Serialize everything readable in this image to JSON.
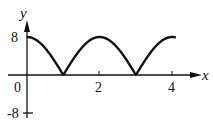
{
  "chart_data": {
    "type": "line",
    "title": "",
    "xlabel": "x",
    "ylabel": "y",
    "function": "y = |8 cos(πx/2)|",
    "xlim": [
      0,
      4.1
    ],
    "ylim": [
      -8,
      8
    ],
    "grid": false,
    "legend": null,
    "x_ticks": [
      "0",
      "2",
      "4"
    ],
    "y_ticks": [
      "8",
      "-8"
    ],
    "series": [
      {
        "name": "curve",
        "x": [
          0,
          0.25,
          0.5,
          0.75,
          1,
          1.25,
          1.5,
          1.75,
          2,
          2.25,
          2.5,
          2.75,
          3,
          3.25,
          3.5,
          3.75,
          4,
          4.1
        ],
        "values": [
          8,
          7.39,
          5.66,
          3.06,
          0,
          3.06,
          5.66,
          7.39,
          8,
          7.39,
          5.66,
          3.06,
          0,
          3.06,
          5.66,
          7.39,
          8,
          7.95
        ]
      }
    ]
  },
  "labels": {
    "x_axis": "x",
    "y_axis": "y",
    "origin": "0",
    "x_tick_2": "2",
    "x_tick_4": "4",
    "y_tick_8": "8",
    "y_tick_neg8": "-8"
  }
}
